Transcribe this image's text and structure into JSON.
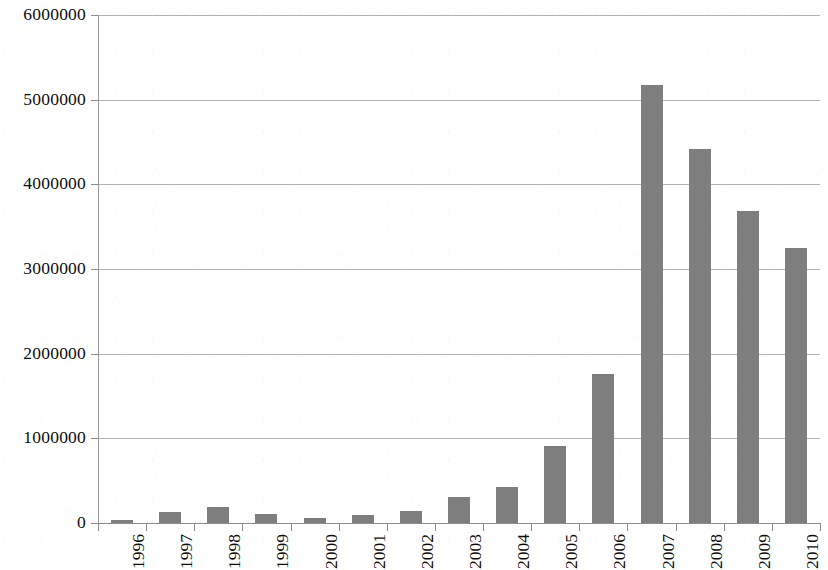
{
  "chart_data": {
    "type": "bar",
    "title": "",
    "subtitle": "",
    "xlabel": "",
    "ylabel": "",
    "categories": [
      "1996",
      "1997",
      "1998",
      "1999",
      "2000",
      "2001",
      "2002",
      "2003",
      "2004",
      "2005",
      "2006",
      "2007",
      "2008",
      "2009",
      "2010"
    ],
    "values": [
      40000,
      130000,
      185000,
      110000,
      60000,
      95000,
      140000,
      310000,
      420000,
      910000,
      1760000,
      5170000,
      4420000,
      3680000,
      3250000
    ],
    "series": [
      {
        "name": "",
        "values": [
          40000,
          130000,
          185000,
          110000,
          60000,
          95000,
          140000,
          310000,
          420000,
          910000,
          1760000,
          5170000,
          4420000,
          3680000,
          3250000
        ]
      }
    ],
    "ylim": [
      0,
      6000000
    ],
    "ytick_values": [
      0,
      1000000,
      2000000,
      3000000,
      4000000,
      5000000,
      6000000
    ],
    "ytick_labels": [
      "0",
      "1000000",
      "2000000",
      "3000000",
      "4000000",
      "5000000",
      "6000000"
    ],
    "grid": "horizontal",
    "legend": "none",
    "bar_color": "#7e7e7e",
    "axis_color": "#8d8d8d",
    "gridline_color": "#b4b4b4",
    "background_color": "#ffffff",
    "xtick_label_rotation": 90
  }
}
